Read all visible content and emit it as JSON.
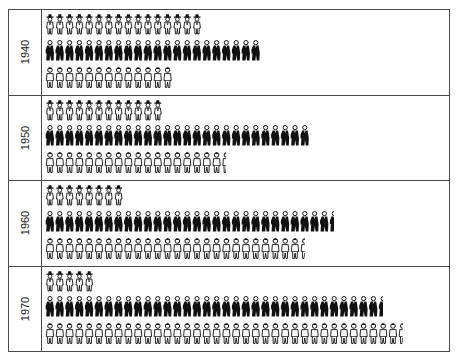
{
  "chart_data": {
    "type": "pictograph",
    "title": "",
    "xlabel": "",
    "ylabel": "",
    "categories": [
      "1940",
      "1950",
      "1960",
      "1970"
    ],
    "series": [
      {
        "name": "Farm workers (hat figure, outline)",
        "icon": "farmer-icon",
        "values": [
          16,
          12,
          8,
          5
        ]
      },
      {
        "name": "White-collar workers (dark suit figure)",
        "icon": "suit-figure-icon",
        "values": [
          22,
          27,
          29.5,
          34.5
        ]
      },
      {
        "name": "Blue-collar/service workers (outline figure)",
        "icon": "worker-icon",
        "values": [
          13,
          18.5,
          26.5,
          36.5
        ]
      }
    ],
    "legend": "none visible",
    "grid": false
  },
  "panels": [
    {
      "year": "1940"
    },
    {
      "year": "1950"
    },
    {
      "year": "1960"
    },
    {
      "year": "1970"
    }
  ],
  "colors": {
    "ink": "#111111",
    "frame": "#4a4a4a",
    "background": "#ffffff"
  }
}
